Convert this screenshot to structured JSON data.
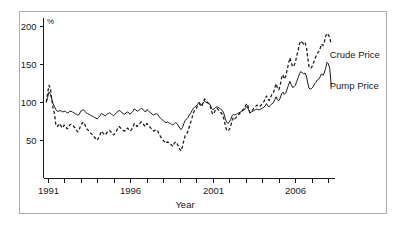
{
  "chart_data": {
    "type": "line",
    "title": "",
    "subtitle": "",
    "xlabel": "Year",
    "ylabel": "",
    "unit_label": "%",
    "grid": false,
    "legend_position": "right-inline",
    "xlim": [
      1990.75,
      2008.4
    ],
    "ylim": [
      0,
      210
    ],
    "y_ticks": [
      50,
      100,
      150,
      200
    ],
    "y_tick_labels": [
      "50",
      "100",
      "150",
      "200"
    ],
    "x_ticks": [
      1991,
      1992,
      1993,
      1994,
      1995,
      1996,
      1997,
      1998,
      1999,
      2000,
      2001,
      2002,
      2003,
      2004,
      2005,
      2006,
      2007,
      2008
    ],
    "x_tick_labels": [
      "1991",
      "",
      "",
      "",
      "",
      "1996",
      "",
      "",
      "",
      "",
      "2001",
      "",
      "",
      "",
      "",
      "2006",
      "",
      ""
    ],
    "x_labeled_ticks": [
      1991,
      1996,
      2001,
      2006
    ],
    "annotations": [
      {
        "text": "Crude Price",
        "x": 2007.9,
        "y": 158,
        "series": "Crude Price"
      },
      {
        "text": "Pump Price",
        "x": 2007.9,
        "y": 117,
        "series": "Pump Price"
      }
    ],
    "series": [
      {
        "name": "Crude Price",
        "style": "dashed",
        "color": "#1a1a1a",
        "x": [
          1990.92,
          1991.0,
          1991.08,
          1991.17,
          1991.25,
          1991.33,
          1991.42,
          1991.5,
          1991.58,
          1991.67,
          1991.75,
          1991.83,
          1991.92,
          1992.0,
          1992.08,
          1992.17,
          1992.25,
          1992.33,
          1992.42,
          1992.5,
          1992.58,
          1992.67,
          1992.75,
          1992.83,
          1992.92,
          1993.0,
          1993.08,
          1993.17,
          1993.25,
          1993.33,
          1993.42,
          1993.5,
          1993.58,
          1993.67,
          1993.75,
          1993.83,
          1993.92,
          1994.0,
          1994.08,
          1994.17,
          1994.25,
          1994.33,
          1994.42,
          1994.5,
          1994.58,
          1994.67,
          1994.75,
          1994.83,
          1994.92,
          1995.0,
          1995.08,
          1995.17,
          1995.25,
          1995.33,
          1995.42,
          1995.5,
          1995.58,
          1995.67,
          1995.75,
          1995.83,
          1995.92,
          1996.0,
          1996.08,
          1996.17,
          1996.25,
          1996.33,
          1996.42,
          1996.5,
          1996.58,
          1996.67,
          1996.75,
          1996.83,
          1996.92,
          1997.0,
          1997.08,
          1997.17,
          1997.25,
          1997.33,
          1997.42,
          1997.5,
          1997.58,
          1997.67,
          1997.75,
          1997.83,
          1997.92,
          1998.0,
          1998.08,
          1998.17,
          1998.25,
          1998.33,
          1998.42,
          1998.5,
          1998.58,
          1998.67,
          1998.75,
          1998.83,
          1998.92,
          1999.0,
          1999.08,
          1999.17,
          1999.25,
          1999.33,
          1999.42,
          1999.5,
          1999.58,
          1999.67,
          1999.75,
          1999.83,
          1999.92,
          2000.0,
          2000.08,
          2000.17,
          2000.25,
          2000.33,
          2000.42,
          2000.5,
          2000.58,
          2000.67,
          2000.75,
          2000.83,
          2000.92,
          2001.0,
          2001.08,
          2001.17,
          2001.25,
          2001.33,
          2001.42,
          2001.5,
          2001.58,
          2001.67,
          2001.75,
          2001.83,
          2001.92,
          2002.0,
          2002.08,
          2002.17,
          2002.25,
          2002.33,
          2002.42,
          2002.5,
          2002.58,
          2002.67,
          2002.75,
          2002.83,
          2002.92,
          2003.0,
          2003.08,
          2003.17,
          2003.25,
          2003.33,
          2003.42,
          2003.5,
          2003.58,
          2003.67,
          2003.75,
          2003.83,
          2003.92,
          2004.0,
          2004.08,
          2004.17,
          2004.25,
          2004.33,
          2004.42,
          2004.5,
          2004.58,
          2004.67,
          2004.75,
          2004.83,
          2004.92,
          2005.0,
          2005.08,
          2005.17,
          2005.25,
          2005.33,
          2005.42,
          2005.5,
          2005.58,
          2005.67,
          2005.75,
          2005.83,
          2005.92,
          2006.0,
          2006.08,
          2006.17,
          2006.25,
          2006.33,
          2006.42,
          2006.5,
          2006.58,
          2006.67,
          2006.75,
          2006.83,
          2006.92,
          2007.0,
          2007.08,
          2007.17,
          2007.25,
          2007.33,
          2007.42,
          2007.5,
          2007.58,
          2007.67,
          2007.75,
          2007.83,
          2007.92,
          2008.0,
          2008.08,
          2008.17
        ],
        "values": [
          100,
          112,
          122,
          118,
          104,
          92,
          84,
          70,
          68,
          70,
          72,
          68,
          66,
          70,
          69,
          65,
          66,
          70,
          71,
          70,
          68,
          66,
          63,
          61,
          64,
          70,
          72,
          74,
          71,
          66,
          64,
          62,
          60,
          58,
          57,
          54,
          52,
          50,
          53,
          57,
          62,
          60,
          58,
          57,
          60,
          62,
          63,
          61,
          58,
          57,
          59,
          62,
          66,
          68,
          66,
          64,
          63,
          62,
          64,
          66,
          64,
          62,
          64,
          68,
          72,
          70,
          68,
          70,
          72,
          74,
          73,
          70,
          68,
          72,
          70,
          68,
          66,
          64,
          62,
          63,
          64,
          62,
          58,
          55,
          52,
          50,
          48,
          46,
          48,
          47,
          45,
          44,
          42,
          46,
          48,
          46,
          42,
          38,
          36,
          42,
          50,
          56,
          58,
          62,
          68,
          74,
          80,
          86,
          90,
          92,
          95,
          98,
          96,
          94,
          100,
          104,
          102,
          100,
          98,
          96,
          88,
          84,
          86,
          90,
          92,
          90,
          88,
          86,
          84,
          78,
          70,
          64,
          62,
          64,
          68,
          76,
          80,
          78,
          80,
          82,
          84,
          86,
          88,
          90,
          92,
          96,
          98,
          92,
          86,
          88,
          90,
          92,
          94,
          96,
          95,
          94,
          96,
          98,
          100,
          104,
          108,
          104,
          102,
          106,
          110,
          112,
          118,
          124,
          118,
          116,
          122,
          132,
          136,
          130,
          134,
          142,
          150,
          158,
          152,
          146,
          148,
          152,
          160,
          168,
          176,
          180,
          178,
          176,
          178,
          172,
          158,
          146,
          144,
          146,
          150,
          156,
          160,
          164,
          166,
          170,
          176,
          174,
          178,
          186,
          190,
          188,
          184,
          176
        ]
      },
      {
        "name": "Pump Price",
        "style": "solid",
        "color": "#1a1a1a",
        "x": [
          1990.92,
          1991.0,
          1991.08,
          1991.17,
          1991.25,
          1991.33,
          1991.42,
          1991.5,
          1991.58,
          1991.67,
          1991.75,
          1991.83,
          1991.92,
          1992.0,
          1992.08,
          1992.17,
          1992.25,
          1992.33,
          1992.42,
          1992.5,
          1992.58,
          1992.67,
          1992.75,
          1992.83,
          1992.92,
          1993.0,
          1993.08,
          1993.17,
          1993.25,
          1993.33,
          1993.42,
          1993.5,
          1993.58,
          1993.67,
          1993.75,
          1993.83,
          1993.92,
          1994.0,
          1994.08,
          1994.17,
          1994.25,
          1994.33,
          1994.42,
          1994.5,
          1994.58,
          1994.67,
          1994.75,
          1994.83,
          1994.92,
          1995.0,
          1995.08,
          1995.17,
          1995.25,
          1995.33,
          1995.42,
          1995.5,
          1995.58,
          1995.67,
          1995.75,
          1995.83,
          1995.92,
          1996.0,
          1996.08,
          1996.17,
          1996.25,
          1996.33,
          1996.42,
          1996.5,
          1996.58,
          1996.67,
          1996.75,
          1996.83,
          1996.92,
          1997.0,
          1997.08,
          1997.17,
          1997.25,
          1997.33,
          1997.42,
          1997.5,
          1997.58,
          1997.67,
          1997.75,
          1997.83,
          1997.92,
          1998.0,
          1998.08,
          1998.17,
          1998.25,
          1998.33,
          1998.42,
          1998.5,
          1998.58,
          1998.67,
          1998.75,
          1998.83,
          1998.92,
          1999.0,
          1999.08,
          1999.17,
          1999.25,
          1999.33,
          1999.42,
          1999.5,
          1999.58,
          1999.67,
          1999.75,
          1999.83,
          1999.92,
          2000.0,
          2000.08,
          2000.17,
          2000.25,
          2000.33,
          2000.42,
          2000.5,
          2000.58,
          2000.67,
          2000.75,
          2000.83,
          2000.92,
          2001.0,
          2001.08,
          2001.17,
          2001.25,
          2001.33,
          2001.42,
          2001.5,
          2001.58,
          2001.67,
          2001.75,
          2001.83,
          2001.92,
          2002.0,
          2002.08,
          2002.17,
          2002.25,
          2002.33,
          2002.42,
          2002.5,
          2002.58,
          2002.67,
          2002.75,
          2002.83,
          2002.92,
          2003.0,
          2003.08,
          2003.17,
          2003.25,
          2003.33,
          2003.42,
          2003.5,
          2003.58,
          2003.67,
          2003.75,
          2003.83,
          2003.92,
          2004.0,
          2004.08,
          2004.17,
          2004.25,
          2004.33,
          2004.42,
          2004.5,
          2004.58,
          2004.67,
          2004.75,
          2004.83,
          2004.92,
          2005.0,
          2005.08,
          2005.17,
          2005.25,
          2005.33,
          2005.42,
          2005.5,
          2005.58,
          2005.67,
          2005.75,
          2005.83,
          2005.92,
          2006.0,
          2006.08,
          2006.17,
          2006.25,
          2006.33,
          2006.42,
          2006.5,
          2006.58,
          2006.67,
          2006.75,
          2006.83,
          2006.92,
          2007.0,
          2007.08,
          2007.17,
          2007.25,
          2007.33,
          2007.42,
          2007.5,
          2007.58,
          2007.67,
          2007.75,
          2007.83,
          2007.92,
          2008.0,
          2008.08,
          2008.17
        ],
        "values": [
          100,
          106,
          113,
          110,
          104,
          98,
          94,
          90,
          88,
          88,
          89,
          88,
          87,
          88,
          88,
          86,
          86,
          88,
          88,
          87,
          86,
          85,
          84,
          83,
          84,
          88,
          89,
          90,
          88,
          86,
          85,
          84,
          83,
          82,
          81,
          80,
          79,
          78,
          80,
          82,
          85,
          84,
          83,
          82,
          84,
          85,
          86,
          85,
          83,
          82,
          84,
          86,
          88,
          89,
          88,
          86,
          85,
          84,
          86,
          87,
          86,
          84,
          86,
          88,
          91,
          90,
          88,
          89,
          90,
          92,
          91,
          89,
          87,
          90,
          89,
          87,
          86,
          84,
          83,
          84,
          85,
          84,
          81,
          79,
          77,
          76,
          74,
          73,
          74,
          73,
          72,
          71,
          70,
          72,
          73,
          72,
          69,
          66,
          64,
          67,
          72,
          76,
          78,
          80,
          83,
          86,
          89,
          92,
          94,
          95,
          97,
          100,
          98,
          96,
          99,
          101,
          100,
          99,
          98,
          97,
          92,
          90,
          91,
          93,
          94,
          93,
          92,
          90,
          89,
          85,
          79,
          74,
          72,
          74,
          77,
          82,
          84,
          83,
          84,
          85,
          86,
          87,
          88,
          89,
          90,
          93,
          94,
          90,
          86,
          87,
          88,
          89,
          90,
          91,
          90,
          90,
          91,
          92,
          93,
          95,
          98,
          95,
          94,
          96,
          98,
          99,
          103,
          107,
          103,
          102,
          105,
          111,
          113,
          110,
          112,
          117,
          122,
          127,
          123,
          119,
          120,
          122,
          127,
          132,
          137,
          140,
          138,
          137,
          138,
          134,
          125,
          118,
          117,
          118,
          120,
          124,
          126,
          129,
          130,
          133,
          137,
          135,
          138,
          144,
          152,
          150,
          144,
          122
        ]
      }
    ]
  }
}
